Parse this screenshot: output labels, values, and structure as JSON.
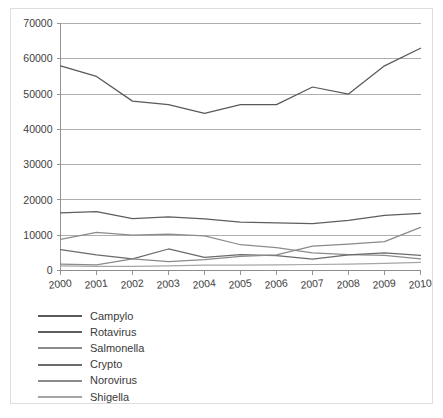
{
  "chart_data": {
    "type": "line",
    "title": "",
    "subtitle": "",
    "xlabel": "",
    "ylabel": "",
    "categories": [
      "2000",
      "2001",
      "2002",
      "2003",
      "2004",
      "2005",
      "2006",
      "2007",
      "2008",
      "2009",
      "2010"
    ],
    "x": [
      2000,
      2001,
      2002,
      2003,
      2004,
      2005,
      2006,
      2007,
      2008,
      2009,
      2010
    ],
    "xlim": [
      2000,
      2010
    ],
    "ylim": [
      0,
      70000
    ],
    "ytick_values": [
      0,
      10000,
      20000,
      30000,
      40000,
      50000,
      60000,
      70000
    ],
    "ytick_labels": [
      "0",
      "10000",
      "20000",
      "30000",
      "40000",
      "50000",
      "60000",
      "70000"
    ],
    "grid": "horizontal",
    "legend_position": "below-plot-left",
    "series": [
      {
        "name": "Campylo",
        "color": "#595959",
        "values": [
          58000,
          55000,
          48000,
          47000,
          44500,
          47000,
          47000,
          52000,
          50000,
          58000,
          63000
        ]
      },
      {
        "name": "Rotavirus",
        "color": "#5e5e5e",
        "values": [
          16300,
          16700,
          14700,
          15200,
          14600,
          13700,
          13500,
          13300,
          14200,
          15600,
          16200
        ]
      },
      {
        "name": "Salmonella",
        "color": "#8c8c8c",
        "values": [
          8800,
          10800,
          10000,
          10300,
          9800,
          7300,
          6500,
          5000,
          4500,
          4300,
          3300
        ]
      },
      {
        "name": "Crypto",
        "color": "#6b6b6b",
        "values": [
          5900,
          4400,
          3300,
          6100,
          3700,
          4500,
          4200,
          3200,
          4400,
          5000,
          4300
        ]
      },
      {
        "name": "Norovirus",
        "color": "#8a8a8a",
        "values": [
          1800,
          1600,
          3300,
          2500,
          3100,
          4000,
          4400,
          6900,
          7500,
          8200,
          12200
        ]
      },
      {
        "name": "Shigella",
        "color": "#a6a6a6",
        "values": [
          1300,
          1200,
          1200,
          1300,
          1500,
          1500,
          1600,
          1700,
          1800,
          2000,
          2300
        ]
      }
    ]
  },
  "legend": {
    "items": [
      {
        "label": "Campylo"
      },
      {
        "label": "Rotavirus"
      },
      {
        "label": "Salmonella"
      },
      {
        "label": "Crypto"
      },
      {
        "label": "Norovirus"
      },
      {
        "label": "Shigella"
      }
    ]
  }
}
